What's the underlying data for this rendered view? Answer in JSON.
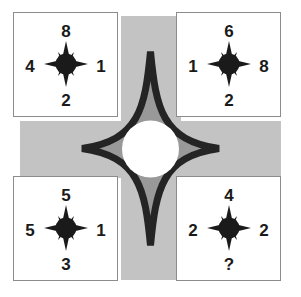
{
  "puzzle": {
    "title": "four-quadrant compass number puzzle",
    "colors": {
      "background": "#ffffff",
      "cross_light_gray": "#c3c3c3",
      "star_dark_gray": "#999999",
      "star_outline": "#242424",
      "card_border": "#8c8c8c",
      "digit": "#1a1a1a",
      "center_circle": "#ffffff"
    },
    "center": {
      "shape_name": "four-pointed-star",
      "circle_label": ""
    },
    "cards": [
      {
        "id": "top-left",
        "icon": "compass-rose-icon",
        "top": "8",
        "left": "4",
        "right": "1",
        "bottom": "2"
      },
      {
        "id": "top-right",
        "icon": "compass-rose-icon",
        "top": "6",
        "left": "1",
        "right": "8",
        "bottom": "2"
      },
      {
        "id": "bottom-left",
        "icon": "compass-rose-icon",
        "top": "5",
        "left": "5",
        "right": "1",
        "bottom": "3"
      },
      {
        "id": "bottom-right",
        "icon": "compass-rose-icon",
        "top": "4",
        "left": "2",
        "right": "2",
        "bottom": "?"
      }
    ]
  }
}
